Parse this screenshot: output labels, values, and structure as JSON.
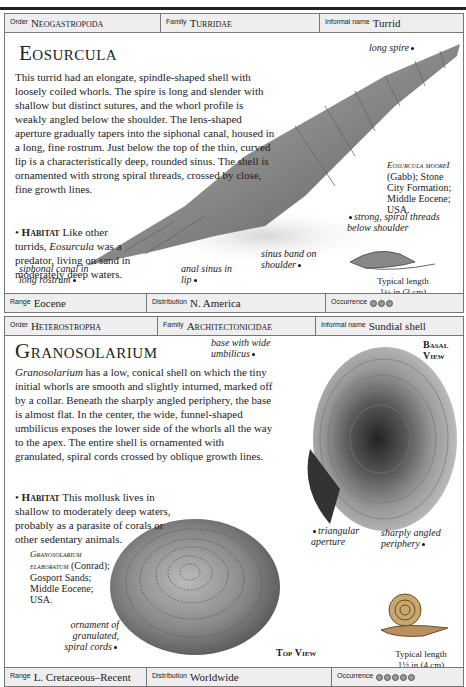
{
  "entries": [
    {
      "header": {
        "order_label": "Order",
        "order": "Neogastropoda",
        "family_label": "Family",
        "family": "Turridae",
        "informal_label": "Informal name",
        "informal": "Turrid"
      },
      "title": "Eosurcula",
      "description": "This turrid had an elongate, spindle-shaped shell with loosely coiled whorls. The spire is long and slender with shallow but distinct sutures, and the whorl profile is weakly angled below the shoulder. The lens-shaped aperture gradually tapers into the siphonal canal, housed in a long, fine rostrum. Just below the top of the thin, curved lip is a characteristically deep, rounded sinus. The shell is ornamented with strong spiral threads, crossed by close, fine growth lines.",
      "habitat_label": "Habitat",
      "habitat_pre": "Like other turrids,",
      "habitat_genus": "Eosurcula",
      "habitat_post": "was a predator, living on sand in moderately deep waters.",
      "annotations": {
        "long_spire": "long spire",
        "siphonal": "siphonal canal in long rostrum",
        "anal_sinus": "anal sinus in lip",
        "sinus_band": "sinus band on shoulder",
        "spiral_threads": "strong, spiral threads below shoulder"
      },
      "specimen": {
        "name": "Eosurcula mooreI",
        "details": "(Gabb); Stone City Formation; Middle Eocene; USA."
      },
      "typical_length_label": "Typical length",
      "typical_length": "1¼ in (3 cm)",
      "footer": {
        "range_label": "Range",
        "range": "Eocene",
        "distribution_label": "Distribution",
        "distribution": "N. America",
        "occurrence_label": "Occurrence",
        "occurrence_count": 3
      }
    },
    {
      "header": {
        "order_label": "Order",
        "order": "Heterostropha",
        "family_label": "Family",
        "family": "Architectonicidae",
        "informal_label": "Informal name",
        "informal": "Sundial shell"
      },
      "title": "Granosolarium",
      "description_genus": "Granosolarium",
      "description": "has a low, conical shell on which the tiny initial whorls are smooth and slightly inturned, marked off by a collar. Beneath the sharply angled periphery, the base is almost flat. In the center, the wide, funnel-shaped umbilicus exposes the lower side of the whorls all the way to the apex. The entire shell is ornamented with granulated, spiral cords crossed by oblique growth lines.",
      "habitat_label": "Habitat",
      "habitat_text": "This mollusk lives in shallow to moderately deep waters, probably as a parasite of corals or other sedentary animals.",
      "annotations": {
        "base": "base with wide umbilicus",
        "aperture": "triangular aperture",
        "periphery": "sharply angled periphery",
        "ornament": "ornament of granulated, spiral cords"
      },
      "views": {
        "basal": "Basal View",
        "top": "Top View"
      },
      "specimen": {
        "name": "Granosolarium elaboratum",
        "details": "(Conrad); Gosport Sands; Middle Eocene; USA."
      },
      "typical_length_label": "Typical length",
      "typical_length": "1½ in (4 cm)",
      "footer": {
        "range_label": "Range",
        "range": "L. Cretaceous–Recent",
        "distribution_label": "Distribution",
        "distribution": "Worldwide",
        "occurrence_label": "Occurrence",
        "occurrence_count": 5
      }
    }
  ]
}
